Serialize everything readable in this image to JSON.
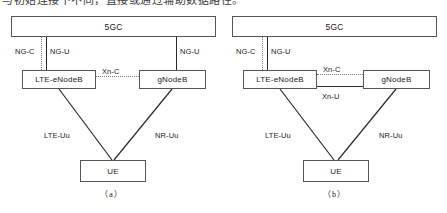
{
  "page": {
    "clipped_header_text": "与初始连接下不同，直接或通过辅助数据路径。"
  },
  "figures": [
    {
      "id": "a",
      "caption": "（a）",
      "nodes": {
        "core": "5GC",
        "master": "LTE-eNodeB",
        "secondary": "gNodeB",
        "terminal": "UE"
      },
      "links": {
        "ng_c": "NG-C",
        "ng_u_left": "NG-U",
        "ng_u_right": "NG-U",
        "xn_c": "Xn-C",
        "lte_uu": "LTE-Uu",
        "nr_uu": "NR-Uu"
      }
    },
    {
      "id": "b",
      "caption": "（b）",
      "nodes": {
        "core": "5GC",
        "master": "LTE-eNodeB",
        "secondary": "gNodeB",
        "terminal": "UE"
      },
      "links": {
        "ng_c": "NG-C",
        "ng_u_left": "NG-U",
        "xn_c": "Xn-C",
        "xn_u": "Xn-U",
        "lte_uu": "LTE-Uu",
        "nr_uu": "NR-Uu"
      }
    }
  ],
  "colors": {
    "line_solid": "#2a2a2a",
    "line_dotted": "#777777",
    "box_border": "#555555",
    "background": "#ffffff"
  }
}
